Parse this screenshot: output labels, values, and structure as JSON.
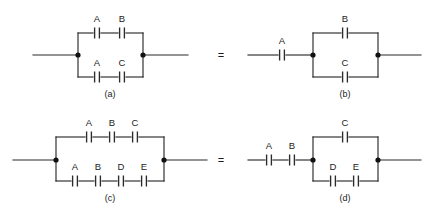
{
  "figure": {
    "background_color": "#ffffff",
    "ink_color": "#2b2b2b",
    "equals_symbol_1": "=",
    "equals_symbol_2": "="
  },
  "circuits": {
    "a": {
      "caption": "(a)",
      "top_branch_labels": [
        "A",
        "B"
      ],
      "bottom_branch_labels": [
        "A",
        "C"
      ],
      "top_branch_count": 2,
      "bottom_branch_count": 2,
      "left_terminal": true,
      "right_terminal": true
    },
    "b": {
      "caption": "(b)",
      "series_labels": [
        "A"
      ],
      "top_branch_labels": [
        "B"
      ],
      "bottom_branch_labels": [
        "C"
      ],
      "series_count": 1,
      "top_branch_count": 1,
      "bottom_branch_count": 1,
      "left_terminal": true,
      "right_terminal": true
    },
    "c": {
      "caption": "(c)",
      "top_branch_labels": [
        "A",
        "B",
        "C"
      ],
      "bottom_branch_labels": [
        "A",
        "B",
        "D",
        "E"
      ],
      "top_branch_count": 3,
      "bottom_branch_count": 4,
      "left_terminal": true,
      "right_terminal": true
    },
    "d": {
      "caption": "(d)",
      "series_labels": [
        "A",
        "B"
      ],
      "top_branch_labels": [
        "C"
      ],
      "bottom_branch_labels": [
        "D",
        "E"
      ],
      "series_count": 2,
      "top_branch_count": 1,
      "bottom_branch_count": 2,
      "left_terminal": true,
      "right_terminal": true
    }
  },
  "symbols": {
    "capacitor": "capacitor-symbol",
    "junction": "junction-dot"
  }
}
